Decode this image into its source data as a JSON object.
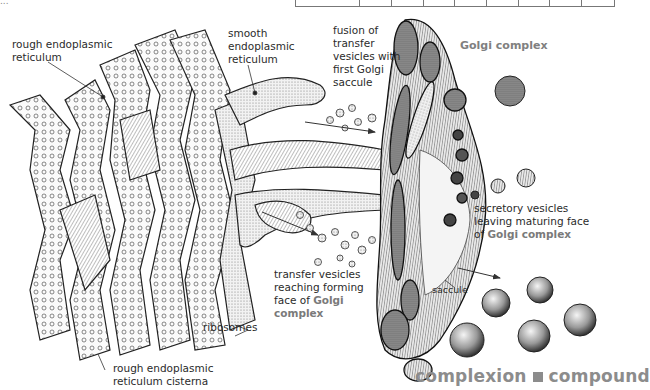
{
  "header": {
    "caption_fragment": "...",
    "table_columns": 9
  },
  "diagram": {
    "title": "Golgi complex",
    "labels": {
      "rough_er": [
        "rough endoplasmic",
        "reticulum"
      ],
      "smooth_er": [
        "smooth",
        "endoplasmic",
        "reticulum"
      ],
      "fusion": [
        "fusion of",
        "transfer",
        "vesicles with",
        "first Golgi",
        "saccule"
      ],
      "secretory": [
        "secretory vesicles",
        "leaving maturing face",
        "of "
      ],
      "secretory_bold": "Golgi complex",
      "transfer": [
        "transfer vesicles",
        "reaching forming",
        "face of "
      ],
      "transfer_bold1": "Golgi",
      "transfer_bold2": "complex",
      "saccule": "saccule",
      "ribosomes": "ribosomes",
      "cisterna": [
        "rough endoplasmic",
        "reticulum cisterna"
      ]
    }
  },
  "footer": {
    "word_left": "complexion",
    "word_right": "compound"
  }
}
